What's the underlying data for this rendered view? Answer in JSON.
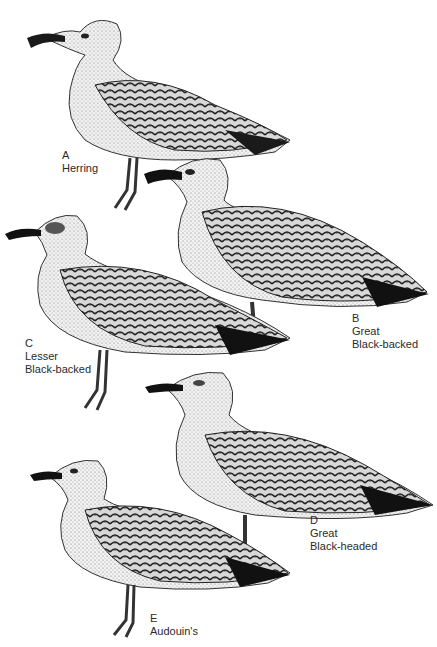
{
  "plate": {
    "background": "#ffffff",
    "ink": "#1a1a1a"
  },
  "birds": [
    {
      "letter": "A",
      "name": "Herring"
    },
    {
      "letter": "B",
      "name_line1": "Great",
      "name_line2": "Black-backed"
    },
    {
      "letter": "C",
      "name_line1": "Lesser",
      "name_line2": "Black-backed"
    },
    {
      "letter": "D",
      "name_line1": "Great",
      "name_line2": "Black-headed"
    },
    {
      "letter": "E",
      "name": "Audouin's"
    }
  ]
}
